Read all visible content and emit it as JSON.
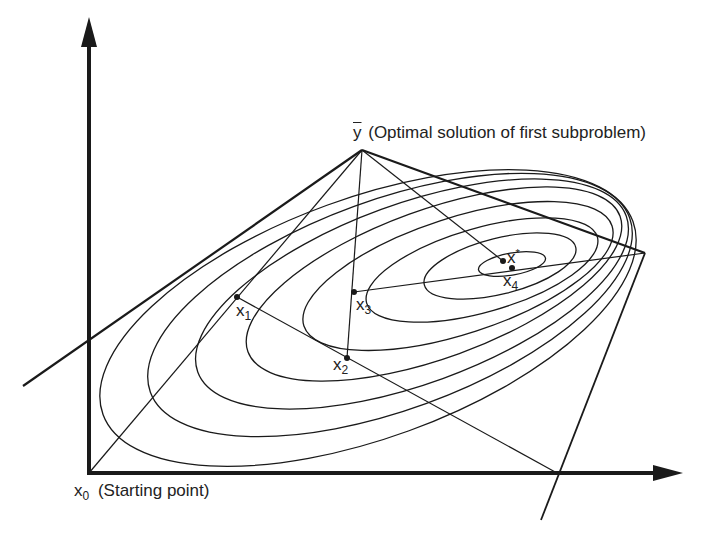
{
  "diagram": {
    "colors": {
      "stroke": "#1a1a1a",
      "background": "#ffffff"
    },
    "labels": {
      "ybar_symbol": "y",
      "ybar_text": "(Optimal solution of first subproblem)",
      "x0_symbol": "x",
      "x0_sub": "0",
      "x0_text": "(Starting point)",
      "x1_symbol": "x",
      "x1_sub": "1",
      "x2_symbol": "x",
      "x2_sub": "2",
      "x3_symbol": "x",
      "x3_sub": "3",
      "x4_symbol": "x",
      "x4_sub": "4",
      "xstar_symbol": "x",
      "xstar_sup": "*"
    },
    "points": {
      "x0": [
        89,
        473
      ],
      "x1": [
        237,
        297
      ],
      "x2": [
        347,
        358
      ],
      "x3": [
        354,
        292
      ],
      "x4": [
        512,
        268
      ],
      "xstar": [
        503,
        261
      ],
      "ybar": [
        362,
        150
      ],
      "right_vertex": [
        645,
        253
      ]
    },
    "axes": {
      "origin": [
        89,
        473
      ],
      "y_arrow_tip": [
        89,
        18
      ],
      "x_arrow_tip": [
        682,
        473
      ]
    }
  }
}
